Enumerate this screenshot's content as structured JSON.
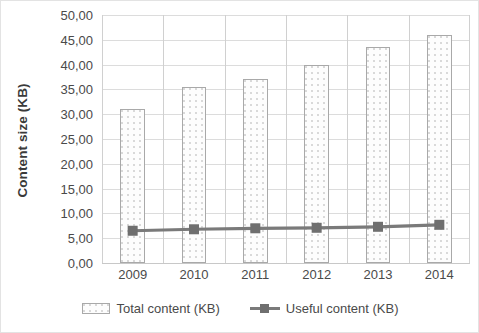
{
  "chart_data": {
    "type": "bar",
    "title": "",
    "subtitle": "",
    "xlabel": "",
    "ylabel": "Content size (KB)",
    "categories": [
      "2009",
      "2010",
      "2011",
      "2012",
      "2013",
      "2014"
    ],
    "series": [
      {
        "name": "Total content (KB)",
        "type": "bar",
        "values": [
          31.0,
          35.5,
          37.0,
          40.0,
          43.5,
          46.0
        ],
        "color": "#fdfdfd",
        "border_color": "#a9a9a9"
      },
      {
        "name": "Useful content (KB)",
        "type": "line",
        "values": [
          6.5,
          6.8,
          7.0,
          7.1,
          7.3,
          7.7
        ],
        "color": "#7a7a7a",
        "marker": "square"
      }
    ],
    "ylim": [
      0,
      50
    ],
    "ytick_step": 5,
    "ytick_labels": [
      "0,00",
      "5,00",
      "10,00",
      "15,00",
      "20,00",
      "25,00",
      "30,00",
      "35,00",
      "40,00",
      "45,00",
      "50,00"
    ],
    "ytick_values": [
      0,
      5,
      10,
      15,
      20,
      25,
      30,
      35,
      40,
      45,
      50
    ],
    "grid": true,
    "grid_axis": "y",
    "legend_position": "bottom",
    "decimal_separator": ","
  },
  "legend": {
    "items": [
      {
        "label": "Total content (KB)",
        "marker": "bar-swatch"
      },
      {
        "label": "Useful content (KB)",
        "marker": "line-square-swatch"
      }
    ]
  },
  "colors": {
    "gridline": "#dcdcdc",
    "axis": "#c8c8c8",
    "text": "#4a4a4a",
    "title_text": "#3a3a3a",
    "line_series": "#7a7a7a",
    "bar_border": "#a9a9a9",
    "bar_fill": "#fdfdfd",
    "background": "#ffffff"
  }
}
